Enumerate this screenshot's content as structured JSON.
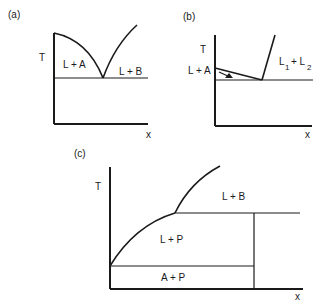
{
  "figure": {
    "panels": [
      {
        "id": "a",
        "label": "(a)",
        "y_axis": "T",
        "x_axis": "x",
        "regions": [
          "L + A",
          "L + B"
        ],
        "description": "Simple eutectic: two liquidus curves meeting at eutectic point on horizontal isotherm"
      },
      {
        "id": "b",
        "label": "(b)",
        "y_axis": "T",
        "x_axis": "x",
        "regions": [
          "L + A",
          "L",
          "1",
          "+ L",
          "2"
        ],
        "region_text": "L1 + L2",
        "description": "Monotectic-type: nearly flat liquidus with arrow, steep boundary of L1+L2 miscibility gap"
      },
      {
        "id": "c",
        "label": "(c)",
        "y_axis": "T",
        "x_axis": "x",
        "regions": [
          "L + B",
          "L + P",
          "A + P"
        ],
        "description": "Peritectic: liquidus curve with kink at peritectic isotherm, vertical compound P line"
      }
    ]
  }
}
